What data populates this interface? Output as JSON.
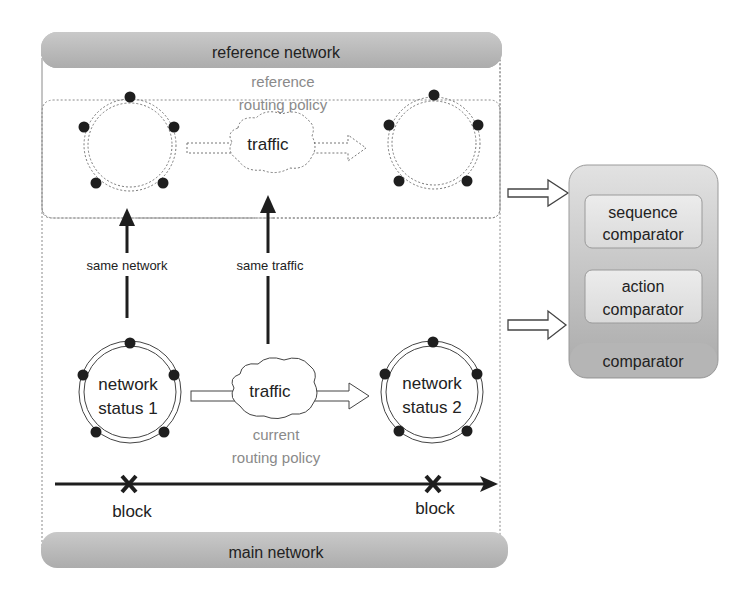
{
  "reference_network": {
    "title": "reference network",
    "policy_line1": "reference",
    "policy_line2": "routing policy",
    "traffic": "traffic"
  },
  "main_network": {
    "title": "main network",
    "status1_line1": "network",
    "status1_line2": "status 1",
    "status2_line1": "network",
    "status2_line2": "status 2",
    "traffic": "traffic",
    "policy_line1": "current",
    "policy_line2": "routing policy",
    "block1": "block",
    "block2": "block"
  },
  "links": {
    "same_network": "same network",
    "same_traffic": "same traffic"
  },
  "comparator": {
    "title": "comparator",
    "sequence_line1": "sequence",
    "sequence_line2": "comparator",
    "action_line1": "action",
    "action_line2": "comparator"
  },
  "colors": {
    "header_fill": "#b8b8b8",
    "comparator_fill": "#c4c4c4",
    "inner_box_fill": "#e6e6e6",
    "node": "#1e1e1e",
    "dashed": "#777777",
    "policy_text": "#8a8a8a"
  }
}
